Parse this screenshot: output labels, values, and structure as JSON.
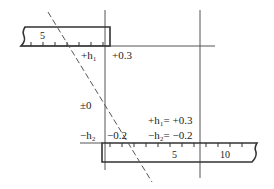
{
  "diagram": {
    "top_ruler": {
      "label": "5"
    },
    "bottom_ruler": {
      "labels": [
        "5",
        "10"
      ]
    },
    "labels": {
      "plus_h1": "+h₁",
      "plus_0_3": "+0.3",
      "zero": "±0",
      "minus_h2": "−h₂",
      "minus_0_2": "−0.2",
      "eq_h1": "+h₁= +0.3",
      "eq_h2": "−h₂= −0.2"
    },
    "colors": {
      "line": "#444444",
      "text": "#222222"
    }
  }
}
